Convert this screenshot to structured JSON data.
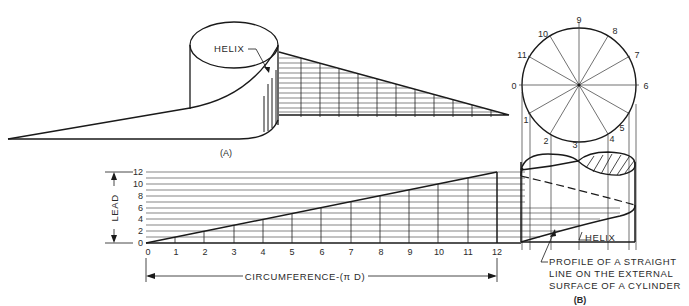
{
  "figure_a": {
    "caption": "(A)",
    "helix_label": "HELIX"
  },
  "development_chart": {
    "lead_label": "LEAD",
    "circumference_label": "CIRCUMFERENCE-(π D)",
    "lead_ticks": [
      "0",
      "2",
      "4",
      "6",
      "8",
      "10",
      "12"
    ],
    "circumference_ticks": [
      "0",
      "1",
      "2",
      "3",
      "4",
      "5",
      "6",
      "7",
      "8",
      "9",
      "10",
      "11",
      "12"
    ]
  },
  "figure_b": {
    "caption": "(B)",
    "circle_divisions": [
      "0",
      "1",
      "2",
      "3",
      "4",
      "5",
      "6",
      "7",
      "8",
      "9",
      "10",
      "11"
    ],
    "helix_label": "HELIX",
    "profile_label_lines": [
      "PROFILE OF A STRAIGHT",
      "LINE ON THE EXTERNAL",
      "SURFACE OF A CYLINDER"
    ]
  },
  "colors": {
    "line": "#1a1a1a",
    "background": "#ffffff"
  }
}
